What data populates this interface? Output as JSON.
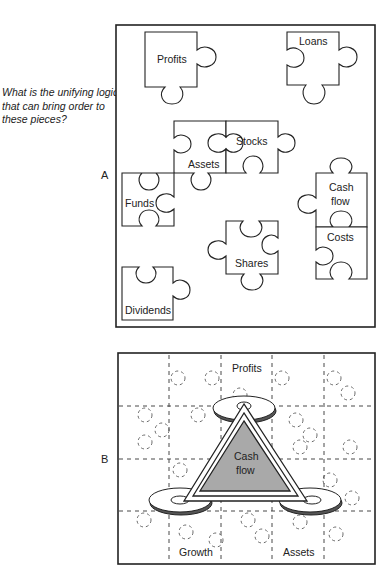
{
  "question": "What is the unifying logic that can bring order to these pieces?",
  "panels": {
    "a": {
      "label": "A",
      "pieces": {
        "profits": "Profits",
        "loans": "Loans",
        "assets": "Assets",
        "stocks": "Stocks",
        "funds": "Funds",
        "cash_flow_line1": "Cash",
        "cash_flow_line2": "flow",
        "costs": "Costs",
        "shares": "Shares",
        "dividends": "Dividends"
      }
    },
    "b": {
      "label": "B",
      "center_line1": "Cash",
      "center_line2": "flow",
      "corners": {
        "top": "Profits",
        "bottom_left": "Growth",
        "bottom_right": "Assets"
      }
    }
  },
  "colors": {
    "triangle_fill": "#a9a9a9",
    "line": "#222222",
    "background": "#ffffff"
  }
}
